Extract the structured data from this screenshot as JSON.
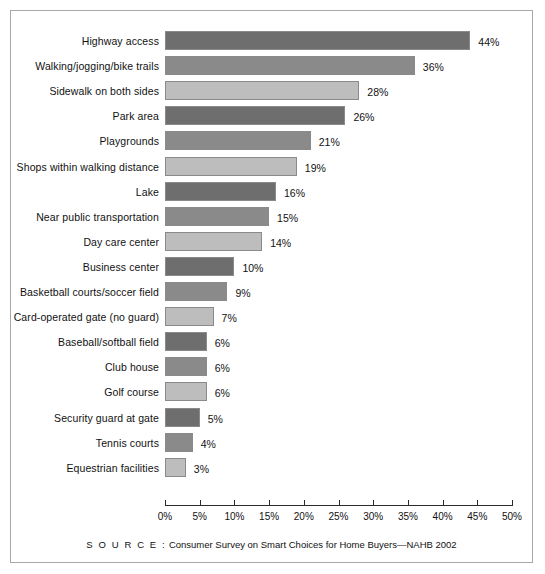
{
  "chart_data": {
    "type": "bar",
    "orientation": "horizontal",
    "title": "",
    "xlabel": "",
    "ylabel": "",
    "xlim": [
      0,
      50
    ],
    "xtick_labels": [
      "0%",
      "5%",
      "10%",
      "15%",
      "20%",
      "25%",
      "30%",
      "35%",
      "40%",
      "45%",
      "50%"
    ],
    "xtick_values": [
      0,
      5,
      10,
      15,
      20,
      25,
      30,
      35,
      40,
      45,
      50
    ],
    "grid": false,
    "legend": "none",
    "categories": [
      "Highway access",
      "Walking/jogging/bike trails",
      "Sidewalk on both sides",
      "Park area",
      "Playgrounds",
      "Shops within walking distance",
      "Lake",
      "Near public transportation",
      "Day care center",
      "Business center",
      "Basketball courts/soccer field",
      "Card-operated gate (no guard)",
      "Baseball/softball field",
      "Club house",
      "Golf course",
      "Security guard at gate",
      "Tennis courts",
      "Equestrian facilities"
    ],
    "values": [
      44,
      36,
      28,
      26,
      21,
      19,
      16,
      15,
      14,
      10,
      9,
      7,
      6,
      6,
      6,
      5,
      4,
      3
    ],
    "value_labels": [
      "44%",
      "36%",
      "28%",
      "26%",
      "21%",
      "19%",
      "16%",
      "15%",
      "14%",
      "10%",
      "9%",
      "7%",
      "6%",
      "6%",
      "6%",
      "5%",
      "4%",
      "3%"
    ],
    "bar_colors": [
      "#6e6e6e",
      "#8a8a8a",
      "#bdbdbd",
      "#6e6e6e",
      "#8a8a8a",
      "#bdbdbd",
      "#6e6e6e",
      "#8a8a8a",
      "#bdbdbd",
      "#6e6e6e",
      "#8a8a8a",
      "#bdbdbd",
      "#6e6e6e",
      "#8a8a8a",
      "#bdbdbd",
      "#6e6e6e",
      "#8a8a8a",
      "#bdbdbd"
    ],
    "palette": {
      "dark": "#6e6e6e",
      "medium": "#8a8a8a",
      "light": "#bdbdbd",
      "bar_border": "#8a8a8a",
      "axis": "#2b2b2b",
      "frame": "#a8a8a8",
      "text": "#111111",
      "background": "#ffffff"
    }
  },
  "source": {
    "prefix": "S O U R C E :",
    "text": " Consumer Survey on Smart Choices for Home Buyers—NAHB 2002"
  },
  "top_sliver": {
    "text": ""
  }
}
